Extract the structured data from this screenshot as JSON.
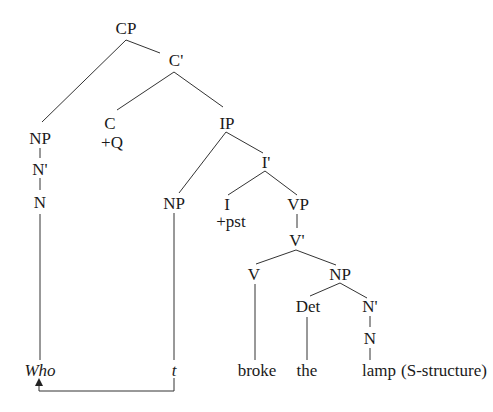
{
  "diagram": {
    "type": "syntax-tree",
    "caption": "(S-structure)",
    "nodes": {
      "cp": "CP",
      "c_bar": "C'",
      "c": "C",
      "c_feature": "+Q",
      "ip": "IP",
      "np_spec_cp": "NP",
      "n_bar_spec_cp": "N'",
      "n_spec_cp": "N",
      "np_subject": "NP",
      "i_bar": "I'",
      "i": "I",
      "i_feature": "+pst",
      "vp": "VP",
      "v_bar": "V'",
      "v": "V",
      "np_object": "NP",
      "det": "Det",
      "n_bar_object": "N'",
      "n_object": "N"
    },
    "leaves": {
      "who": "Who",
      "trace": "t",
      "broke": "broke",
      "the": "the",
      "lamp": "lamp"
    },
    "movement_arrow": {
      "from": "t",
      "to": "Who"
    },
    "line_color": "#333333"
  }
}
